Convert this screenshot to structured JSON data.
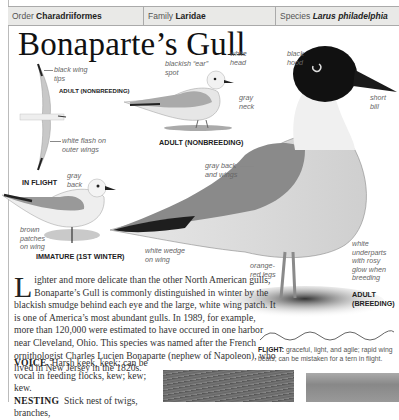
{
  "header": {
    "order_label": "Order",
    "order_value": "Charadriiformes",
    "family_label": "Family",
    "family_value": "Laridae",
    "species_label": "Species",
    "species_value": "Larus philadelphia"
  },
  "title": "Bonaparte’s Gull",
  "illustrations": {
    "in_flight": {
      "caption": "IN FLIGHT",
      "sub_caption": "ADULT (NONBREEDING)",
      "labels": [
        "black wing tips",
        "white flash on outer wings"
      ]
    },
    "adult_nonbreeding": {
      "caption": "ADULT (NONBREEDING)",
      "labels": [
        "blackish “ear” spot",
        "white head",
        "gray neck"
      ]
    },
    "immature": {
      "caption": "IMMATURE (1ST WINTER)",
      "labels": [
        "gray back",
        "brown patches on wing"
      ]
    },
    "adult_breeding": {
      "caption": "ADULT (BREEDING)",
      "labels": [
        "black hood",
        "short bill",
        "gray back and wings",
        "white wedge on wing",
        "orange-red legs",
        "white underparts with rosy glow when breeding"
      ]
    }
  },
  "description": {
    "drop_cap": "L",
    "text": "ighter and more delicate than the other North American gulls, Bonaparte’s Gull is commonly distinguished in winter by the blackish smudge behind each eye and the large, white wing patch. It is one of America’s most abundant gulls. In 1989, for example, more than 120,000 were estimated to have occured in one harbor near Cleveland, Ohio. This species was named after the French ornithologist Charles Lucien Bonaparte (nephew of Napoleon), who lived in New Jersey in the 1820s."
  },
  "voice": {
    "label": "VOICE",
    "text": "Harsh keek, keek; can be vocal in feeding flocks, kew; kew; kew."
  },
  "nesting": {
    "label": "NESTING",
    "text": "Stick nest of twigs, branches,"
  },
  "flight": {
    "label": "FLIGHT:",
    "text": "graceful, light, and agile; rapid wing beats; can be mistaken for a tern in flight."
  }
}
